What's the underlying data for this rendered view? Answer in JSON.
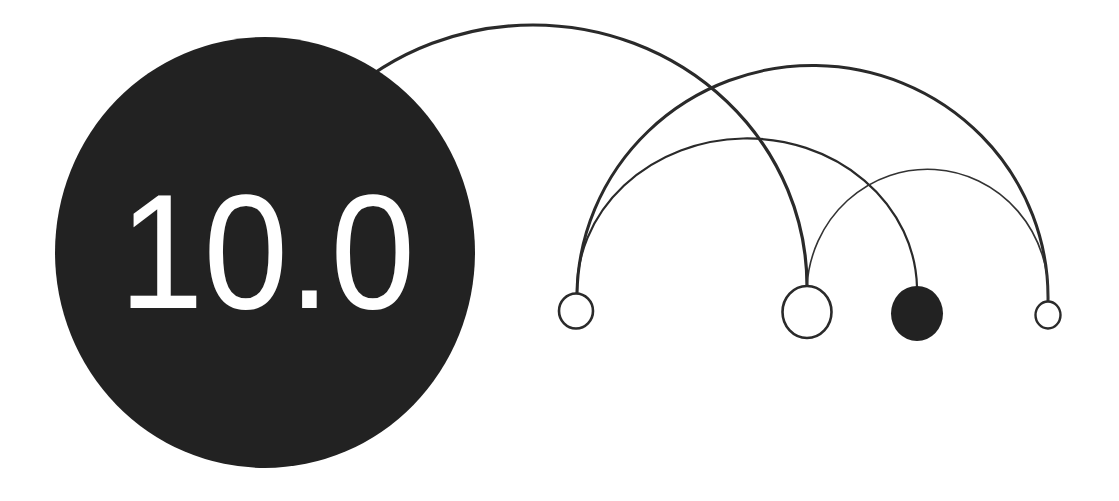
{
  "graphic": {
    "label": "10.0",
    "colors": {
      "background": "#ffffff",
      "ink": "#222222",
      "label": "#ffffff"
    }
  },
  "nodes": [
    {
      "id": "n1",
      "style": "outline",
      "cx": 576,
      "cy": 311,
      "rx": 17.5,
      "ry": 18
    },
    {
      "id": "n2",
      "style": "outline",
      "cx": 807,
      "cy": 312,
      "rx": 25.5,
      "ry": 26.5
    },
    {
      "id": "n3",
      "style": "filled",
      "cx": 917,
      "cy": 313,
      "rx": 26,
      "ry": 27
    },
    {
      "id": "n4",
      "style": "outline",
      "cx": 1048,
      "cy": 315,
      "rx": 13.5,
      "ry": 14
    }
  ],
  "arcs": [
    {
      "from": "big-circle",
      "to": "n2"
    },
    {
      "from": "n1",
      "to": "n4"
    },
    {
      "from": "n1",
      "to": "n3"
    },
    {
      "from": "n2",
      "to": "n4"
    }
  ]
}
